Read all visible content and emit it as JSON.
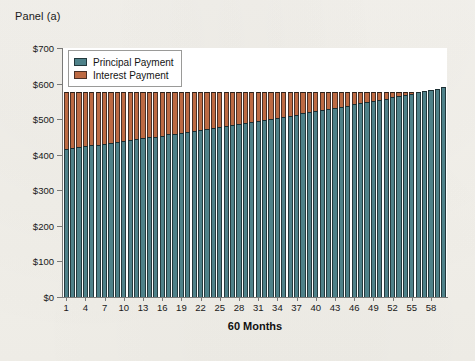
{
  "panel": {
    "title": "Panel (a)"
  },
  "legend": {
    "position": "top-left-inside",
    "items": [
      {
        "label": "Principal Payment",
        "color": "#4e8189",
        "icon": "legend-swatch-principal"
      },
      {
        "label": "Interest Payment",
        "color": "#bd6a43",
        "icon": "legend-swatch-interest"
      }
    ]
  },
  "axis": {
    "x_title": "60 Months",
    "y_tick_labels": [
      "$0",
      "$100",
      "$200",
      "$300",
      "$400",
      "$500",
      "$600",
      "$700"
    ],
    "x_tick_labels": [
      "1",
      "4",
      "7",
      "10",
      "13",
      "16",
      "19",
      "22",
      "25",
      "28",
      "31",
      "34",
      "37",
      "40",
      "43",
      "46",
      "49",
      "52",
      "55",
      "58"
    ]
  },
  "chart_data": {
    "type": "bar",
    "stacked": true,
    "title": "Panel (a)",
    "xlabel": "60 Months",
    "ylabel": "",
    "ylim": [
      0,
      700
    ],
    "ytick_values": [
      0,
      100,
      200,
      300,
      400,
      500,
      600,
      700
    ],
    "ytick_labels": [
      "$0",
      "$100",
      "$200",
      "$300",
      "$400",
      "$500",
      "$600",
      "$700"
    ],
    "xlim": [
      0.5,
      60.5
    ],
    "xtick_values": [
      1,
      4,
      7,
      10,
      13,
      16,
      19,
      22,
      25,
      28,
      31,
      34,
      37,
      40,
      43,
      46,
      49,
      52,
      55,
      58
    ],
    "xtick_labels": [
      "1",
      "4",
      "7",
      "10",
      "13",
      "16",
      "19",
      "22",
      "25",
      "28",
      "31",
      "34",
      "37",
      "40",
      "43",
      "46",
      "49",
      "52",
      "55",
      "58"
    ],
    "grid": false,
    "legend_position": "upper left (inside plot)",
    "categories": [
      1,
      2,
      3,
      4,
      5,
      6,
      7,
      8,
      9,
      10,
      11,
      12,
      13,
      14,
      15,
      16,
      17,
      18,
      19,
      20,
      21,
      22,
      23,
      24,
      25,
      26,
      27,
      28,
      29,
      30,
      31,
      32,
      33,
      34,
      35,
      36,
      37,
      38,
      39,
      40,
      41,
      42,
      43,
      44,
      45,
      46,
      47,
      48,
      49,
      50,
      51,
      52,
      53,
      54,
      55,
      56,
      57,
      58,
      59,
      60
    ],
    "series": [
      {
        "name": "Principal Payment",
        "color": "#4e8189",
        "values": [
          416,
          419,
          421,
          424,
          426,
          428,
          431,
          433,
          436,
          438,
          441,
          443,
          446,
          449,
          451,
          454,
          457,
          459,
          462,
          465,
          467,
          470,
          473,
          476,
          478,
          481,
          484,
          487,
          490,
          493,
          496,
          498,
          501,
          504,
          507,
          510,
          513,
          517,
          520,
          523,
          526,
          529,
          532,
          535,
          538,
          542,
          545,
          548,
          551,
          555,
          558,
          561,
          565,
          568,
          571,
          575,
          578,
          582,
          585,
          589
        ]
      },
      {
        "name": "Interest Payment",
        "color": "#bd6a43",
        "values": [
          160,
          158,
          155,
          153,
          150,
          148,
          145,
          143,
          140,
          138,
          135,
          133,
          130,
          127,
          125,
          122,
          119,
          117,
          114,
          111,
          109,
          106,
          103,
          100,
          98,
          95,
          92,
          89,
          86,
          83,
          80,
          78,
          75,
          72,
          69,
          66,
          63,
          59,
          56,
          53,
          50,
          47,
          44,
          41,
          38,
          34,
          31,
          28,
          25,
          21,
          18,
          15,
          11,
          8,
          5,
          1,
          0,
          0,
          0,
          0
        ]
      }
    ],
    "totals_note": "Each stacked bar sums to the level monthly payment (~$576)"
  }
}
